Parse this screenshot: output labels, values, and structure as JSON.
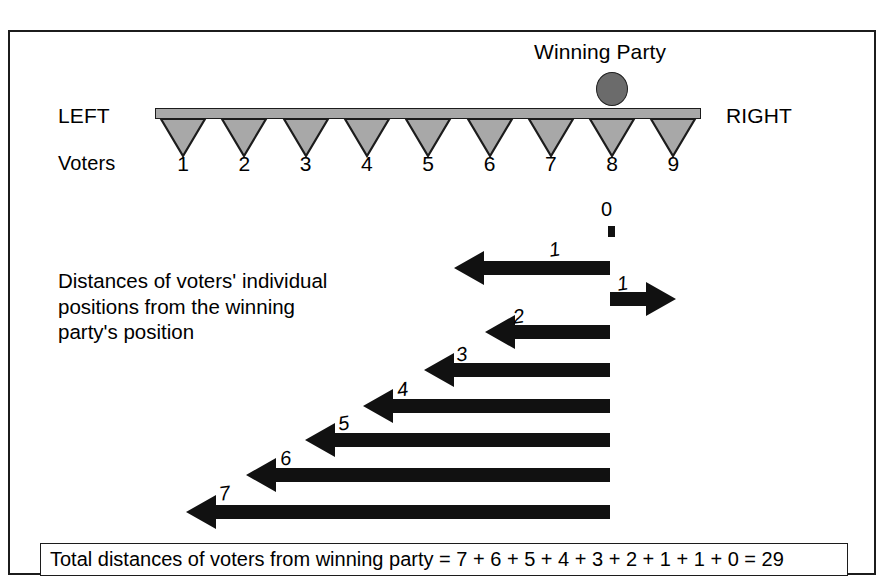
{
  "figure": {
    "title_label": "Winning Party",
    "left_pole_label": "LEFT",
    "right_pole_label": "RIGHT",
    "voters_row_label": "Voters",
    "description": "Distances of voters' individual positions from the winning party's position",
    "zero_label": "0",
    "caption": "Total distances of voters from winning party = 7 + 6 + 5 + 4 + 3 + 2  + 1 + 1 + 0 = 29"
  },
  "voters": [
    {
      "number": "1",
      "distance": "7",
      "direction": "left"
    },
    {
      "number": "2",
      "distance": "6",
      "direction": "left"
    },
    {
      "number": "3",
      "distance": "5",
      "direction": "left"
    },
    {
      "number": "4",
      "distance": "4",
      "direction": "left"
    },
    {
      "number": "5",
      "distance": "3",
      "direction": "left"
    },
    {
      "number": "6",
      "distance": "2",
      "direction": "left"
    },
    {
      "number": "7",
      "distance": "1",
      "direction": "left"
    },
    {
      "number": "8",
      "distance": "0",
      "direction": "none"
    },
    {
      "number": "9",
      "distance": "1",
      "direction": "right"
    }
  ],
  "arrow_labels": {
    "a1_left": "1",
    "a1_right": "1",
    "a2": "2",
    "a3": "3",
    "a4": "4",
    "a5": "5",
    "a6": "6",
    "a7": "7"
  },
  "colors": {
    "ink": "#1c1c1c",
    "triangle_fill": "#a8a8a8",
    "bar_fill": "#a8a8a8",
    "winning_party_fill": "#6b6b6b",
    "background": "#ffffff"
  },
  "chart_data": {
    "type": "bar",
    "categories": [
      "1",
      "2",
      "3",
      "4",
      "5",
      "6",
      "7",
      "8",
      "9"
    ],
    "values": [
      7,
      6,
      5,
      4,
      3,
      2,
      1,
      0,
      1
    ],
    "signed_values": [
      -7,
      -6,
      -5,
      -4,
      -3,
      -2,
      -1,
      0,
      1
    ],
    "xlabel": "Voters",
    "ylabel": "Distance from winning party",
    "winning_party_position": 8,
    "total": 29,
    "axis_left_label": "LEFT",
    "axis_right_label": "RIGHT"
  }
}
